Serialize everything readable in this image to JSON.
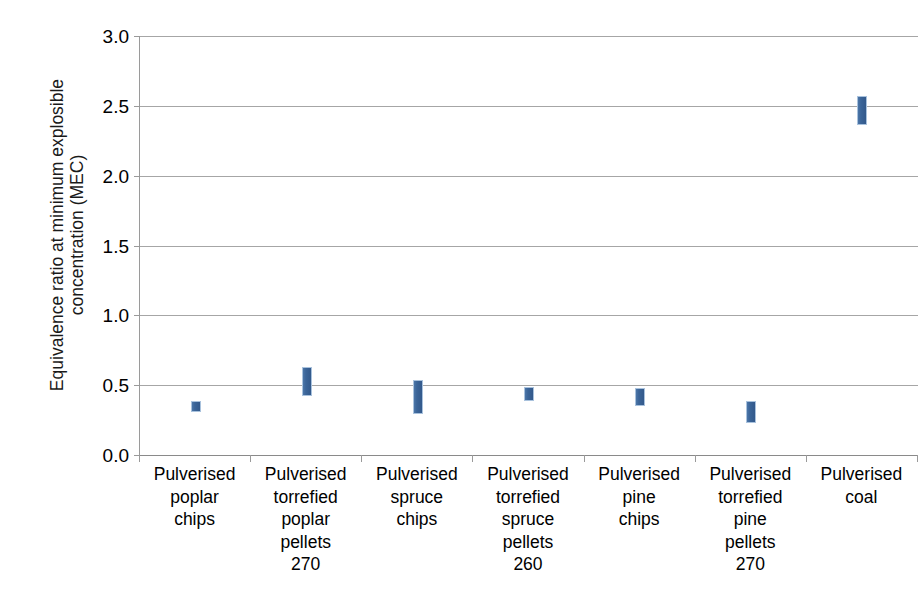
{
  "chart_data": {
    "type": "bar",
    "subtype": "floating-range-bar",
    "title": "",
    "xlabel": "",
    "ylabel": "Equivalence ratio at minimum explosible concentration (MEC)",
    "ylabel_lines": [
      "Equivalence ratio at minimum explosible",
      "concentration (MEC)"
    ],
    "ylim": [
      0.0,
      3.0
    ],
    "ytick_labels": [
      "0.0",
      "0.5",
      "1.0",
      "1.5",
      "2.0",
      "2.5",
      "3.0"
    ],
    "yticks": [
      0.0,
      0.5,
      1.0,
      1.5,
      2.0,
      2.5,
      3.0
    ],
    "grid": true,
    "grid_axis": "y",
    "legend": "none",
    "bar_color": "#3b6599",
    "bar_border_color": "#a9c2dd",
    "gridline_color": "#a6a6a6",
    "axis_color": "#9a9a9a",
    "categories": [
      "Pulverised poplar chips",
      "Pulverised torrefied poplar pellets 270",
      "Pulverised spruce chips",
      "Pulverised torrefied spruce pellets 260",
      "Pulverised pine chips",
      "Pulverised torrefied pine pellets 270",
      "Pulverised coal"
    ],
    "category_label_lines": [
      [
        "Pulverised",
        "poplar",
        "chips"
      ],
      [
        "Pulverised",
        "torrefied",
        "poplar",
        "pellets",
        "270"
      ],
      [
        "Pulverised",
        "spruce",
        "chips"
      ],
      [
        "Pulverised",
        "torrefied",
        "spruce",
        "pellets",
        "260"
      ],
      [
        "Pulverised",
        "pine",
        "chips"
      ],
      [
        "Pulverised",
        "torrefied",
        "pine",
        "pellets",
        "270"
      ],
      [
        "Pulverised",
        "coal"
      ]
    ],
    "low": [
      0.31,
      0.42,
      0.29,
      0.39,
      0.35,
      0.23,
      2.36
    ],
    "high": [
      0.39,
      0.63,
      0.54,
      0.49,
      0.48,
      0.39,
      2.57
    ],
    "series": [
      {
        "name": "Range low",
        "values": [
          0.31,
          0.42,
          0.29,
          0.39,
          0.35,
          0.23,
          2.36
        ]
      },
      {
        "name": "Range high",
        "values": [
          0.39,
          0.63,
          0.54,
          0.49,
          0.48,
          0.39,
          2.57
        ]
      }
    ]
  }
}
